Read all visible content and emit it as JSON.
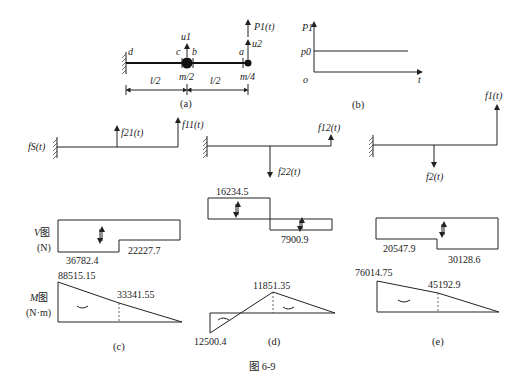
{
  "figure": {
    "caption": "图 6-9",
    "panel_a": {
      "label": "(a)",
      "points": [
        "d",
        "c",
        "b",
        "a"
      ],
      "masses": [
        "m/2",
        "m/4"
      ],
      "displacements": [
        "u2",
        "u1"
      ],
      "load": "P1(t)",
      "spans": [
        "l/2",
        "l/2"
      ]
    },
    "panel_b": {
      "label": "(b)",
      "y_axis": "P1",
      "level": "p0",
      "origin": "o",
      "x_axis": "t"
    },
    "fbd": {
      "left": {
        "support_force": "fS(t)",
        "forces": [
          "f21(t)",
          "f11(t)"
        ]
      },
      "middle": {
        "forces": [
          "f12(t)",
          "f22(t)"
        ]
      },
      "right": {
        "forces": [
          "f1(t)",
          "f2(t)"
        ]
      }
    },
    "shear_diagram": {
      "title": "V图",
      "unit": "(N)",
      "c": {
        "values": [
          "36782.4",
          "22227.7"
        ]
      },
      "d": {
        "values": [
          "16234.5",
          "7900.9"
        ]
      },
      "e": {
        "values": [
          "20547.9",
          "30128.6"
        ]
      }
    },
    "moment_diagram": {
      "title": "M图",
      "unit": "(N·m)",
      "c": {
        "values": [
          "88515.15",
          "33341.55"
        ]
      },
      "d": {
        "values": [
          "11851.35",
          "12500.4"
        ]
      },
      "e": {
        "values": [
          "76014.75",
          "45192.9"
        ]
      }
    },
    "sublabels": [
      "(c)",
      "(d)",
      "(e)"
    ]
  }
}
